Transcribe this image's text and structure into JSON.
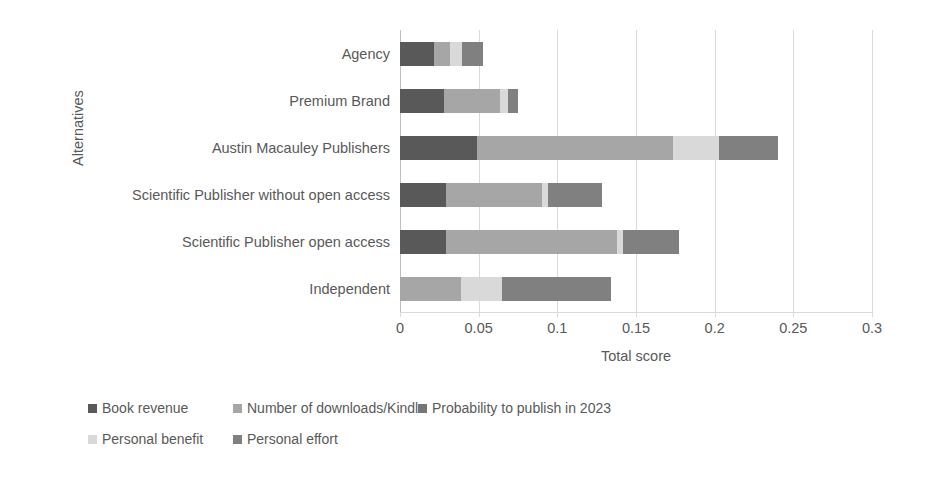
{
  "chart_data": {
    "type": "bar",
    "orientation": "horizontal",
    "stacked": true,
    "title": "",
    "xlabel": "Total score",
    "ylabel": "Alternatives",
    "xlim": [
      0,
      0.3
    ],
    "xticks": [
      "0",
      "0.05",
      "0.1",
      "0.15",
      "0.2",
      "0.25",
      "0.3"
    ],
    "xtick_values": [
      0,
      0.05,
      0.1,
      0.15,
      0.2,
      0.25,
      0.3
    ],
    "grid": "vertical",
    "legend_position": "bottom",
    "categories": [
      "Agency",
      "Premium Brand",
      "Austin Macauley Publishers",
      "Scientific Publisher without open access",
      "Scientific Publisher open access",
      "Independent"
    ],
    "series": [
      {
        "name": "Book revenue",
        "color": "#595959",
        "values": [
          0.0215,
          0.028,
          0.049,
          0.029,
          0.029,
          0.0
        ]
      },
      {
        "name": "Number of downloads/Kindle",
        "color": "#a6a6a6",
        "values": [
          0.0105,
          0.0355,
          0.1245,
          0.061,
          0.109,
          0.039
        ]
      },
      {
        "name": "Probability to publish in 2023",
        "color": "#767676",
        "values": [
          0.0,
          0.0,
          0.0,
          0.0,
          0.0,
          0.0
        ]
      },
      {
        "name": "Personal benefit",
        "color": "#d9d9d9",
        "values": [
          0.0075,
          0.005,
          0.029,
          0.004,
          0.004,
          0.026
        ]
      },
      {
        "name": "Personal effort",
        "color": "#808080",
        "values": [
          0.013,
          0.0065,
          0.0375,
          0.0345,
          0.0355,
          0.069
        ]
      }
    ],
    "totals": [
      0.0525,
      0.075,
      0.24,
      0.1285,
      0.1775,
      0.134
    ]
  },
  "legend": {
    "rows": [
      [
        {
          "label": "Book revenue",
          "color": "#595959",
          "left": 0
        },
        {
          "label": "Number of downloads/Kindle",
          "color": "#a6a6a6",
          "left": 145
        },
        {
          "label": "Probability to publish in 2023",
          "color": "#767676",
          "left": 330
        }
      ],
      [
        {
          "label": "Personal benefit",
          "color": "#d9d9d9",
          "left": 0
        },
        {
          "label": "Personal effort",
          "color": "#808080",
          "left": 145
        }
      ]
    ]
  },
  "colors": {
    "text": "#595959",
    "gridline": "#d9d9d9",
    "background": "#ffffff"
  }
}
